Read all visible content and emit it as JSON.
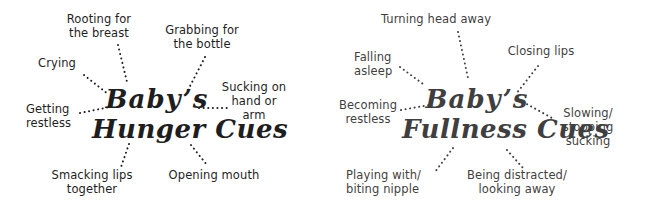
{
  "hunger": {
    "title_line1": "Baby’s",
    "title_line2": "Hunger Cues",
    "color": "#1e1e1e",
    "cues": [
      {
        "lines": [
          "Rooting for",
          "the breast"
        ]
      },
      {
        "lines": [
          "Grabbing for",
          "the bottle"
        ]
      },
      {
        "lines": [
          "Crying"
        ]
      },
      {
        "lines": [
          "Sucking on",
          "hand or",
          "arm"
        ]
      },
      {
        "lines": [
          "Getting",
          "restless"
        ]
      },
      {
        "lines": [
          "Smacking lips",
          "together"
        ]
      },
      {
        "lines": [
          "Opening mouth"
        ]
      }
    ]
  },
  "fullness": {
    "title_line1": "Baby’s",
    "title_line2": "Fullness Cues",
    "color": "#3f3f3f",
    "cues": [
      {
        "lines": [
          "Turning head away"
        ]
      },
      {
        "lines": [
          "Falling",
          "asleep"
        ]
      },
      {
        "lines": [
          "Closing lips"
        ]
      },
      {
        "lines": [
          "Becoming",
          "restless"
        ]
      },
      {
        "lines": [
          "Slowing/",
          "stopping",
          "sucking"
        ]
      },
      {
        "lines": [
          "Playing with/",
          "biting nipple"
        ]
      },
      {
        "lines": [
          "Being distracted/",
          "looking away"
        ]
      }
    ]
  }
}
